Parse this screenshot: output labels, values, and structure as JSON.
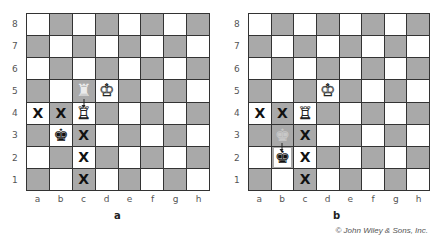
{
  "figure": {
    "copyright": "© John Wiley & Sons, Inc.",
    "files": [
      "a",
      "b",
      "c",
      "d",
      "e",
      "f",
      "g",
      "h"
    ],
    "ranks": [
      "8",
      "7",
      "6",
      "5",
      "4",
      "3",
      "2",
      "1"
    ],
    "colors": {
      "light_square": "#ffffff",
      "dark_square": "#a9a9a9",
      "grid_line": "#333333"
    },
    "glyphs": {
      "x_mark": "X",
      "white_rook": "♖",
      "white_king": "♔",
      "black_king": "♚",
      "ghost_rook": "♜",
      "ghost_king": "♚"
    }
  },
  "diagrams": [
    {
      "caption": "a",
      "pieces": [
        {
          "square": "c5",
          "piece": "white-rook-ghost",
          "note": "previous position, arrow to c4"
        },
        {
          "square": "c4",
          "piece": "white-rook"
        },
        {
          "square": "d5",
          "piece": "white-king"
        },
        {
          "square": "b3",
          "piece": "black-king"
        }
      ],
      "marks": [
        "a4",
        "b4",
        "c3",
        "c2",
        "c1"
      ]
    },
    {
      "caption": "b",
      "pieces": [
        {
          "square": "c4",
          "piece": "white-rook"
        },
        {
          "square": "d5",
          "piece": "white-king"
        },
        {
          "square": "b3",
          "piece": "black-king-ghost",
          "note": "previous position, arrow to b2"
        },
        {
          "square": "b2",
          "piece": "black-king"
        }
      ],
      "marks": [
        "a4",
        "b4",
        "c3",
        "c2",
        "c1"
      ]
    }
  ]
}
